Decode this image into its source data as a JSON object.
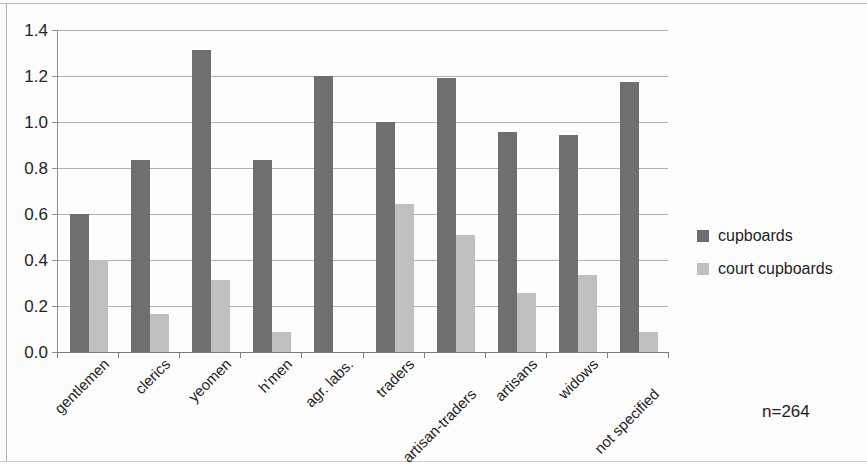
{
  "chart_data": {
    "type": "bar",
    "title": "",
    "subtitle": "",
    "xlabel": "",
    "ylabel": "",
    "grid": true,
    "legend_position": "right",
    "ylim": [
      0.0,
      1.4
    ],
    "ytick_labels": [
      "1.4",
      "1.2",
      "1.0",
      "0.8",
      "0.6",
      "0.4",
      "0.2",
      "0.0"
    ],
    "ytick_values": [
      1.4,
      1.2,
      1.0,
      0.8,
      0.6,
      0.4,
      0.2,
      0.0
    ],
    "categories": [
      "gentlemen",
      "clerics",
      "yeomen",
      "h'men",
      "agr. labs.",
      "traders",
      "artisan-traders",
      "artisans",
      "widows",
      "not specified"
    ],
    "series": [
      {
        "name": "cupboards",
        "color": "#6f6f6f",
        "values": [
          0.6,
          0.835,
          1.315,
          0.835,
          1.2,
          1.0,
          1.19,
          0.955,
          0.945,
          1.175
        ]
      },
      {
        "name": "court cupboards",
        "color": "#c0c0c0",
        "values": [
          0.4,
          0.165,
          0.315,
          0.085,
          0.0,
          0.645,
          0.51,
          0.255,
          0.335,
          0.085
        ]
      }
    ],
    "annotations": [
      {
        "text": "n=264"
      }
    ]
  },
  "legend": {
    "items": [
      {
        "label": "cupboards"
      },
      {
        "label": "court cupboards"
      }
    ]
  },
  "footnote": {
    "sample_size": "n=264"
  }
}
